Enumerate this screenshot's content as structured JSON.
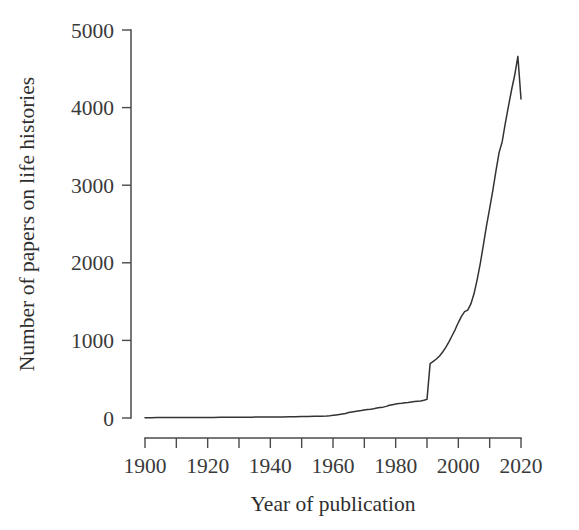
{
  "chart_data": {
    "type": "line",
    "title": "",
    "xlabel": "Year of publication",
    "ylabel": "Number of papers on life histories",
    "xlim": [
      1900,
      2020
    ],
    "ylim": [
      0,
      5000
    ],
    "grid": false,
    "legend": "none",
    "xticks": [
      1900,
      1910,
      1920,
      1930,
      1940,
      1950,
      1960,
      1970,
      1980,
      1990,
      2000,
      2010,
      2020
    ],
    "xtick_labels": [
      "1900",
      "",
      "1920",
      "",
      "1940",
      "",
      "1960",
      "",
      "1980",
      "",
      "2000",
      "",
      "2020"
    ],
    "xtick_labels_shown": [
      "1900",
      "1920",
      "1940",
      "1960",
      "1980",
      "2000",
      "2020"
    ],
    "yticks": [
      0,
      1000,
      2000,
      3000,
      4000,
      5000
    ],
    "ytick_labels": [
      "0",
      "1000",
      "2000",
      "3000",
      "4000",
      "5000"
    ],
    "series_name": "Papers on life histories",
    "line_color": "#333333",
    "x": [
      1900,
      1902,
      1904,
      1906,
      1908,
      1910,
      1912,
      1914,
      1916,
      1918,
      1920,
      1922,
      1924,
      1926,
      1928,
      1930,
      1932,
      1934,
      1936,
      1938,
      1940,
      1942,
      1944,
      1946,
      1948,
      1950,
      1952,
      1954,
      1956,
      1958,
      1959,
      1960,
      1961,
      1962,
      1963,
      1964,
      1965,
      1966,
      1967,
      1968,
      1969,
      1970,
      1971,
      1972,
      1973,
      1974,
      1975,
      1976,
      1977,
      1978,
      1979,
      1980,
      1981,
      1982,
      1983,
      1984,
      1985,
      1986,
      1987,
      1988,
      1989,
      1990,
      1991,
      1992,
      1993,
      1994,
      1995,
      1996,
      1997,
      1998,
      1999,
      2000,
      2001,
      2002,
      2003,
      2004,
      2005,
      2006,
      2007,
      2008,
      2009,
      2010,
      2011,
      2012,
      2013,
      2014,
      2015,
      2016,
      2017,
      2018,
      2019,
      2020
    ],
    "values": [
      4,
      4,
      5,
      5,
      5,
      6,
      6,
      6,
      7,
      7,
      8,
      8,
      9,
      9,
      10,
      10,
      11,
      11,
      12,
      12,
      13,
      13,
      14,
      15,
      16,
      18,
      20,
      22,
      24,
      27,
      30,
      34,
      40,
      46,
      52,
      58,
      70,
      78,
      84,
      90,
      96,
      104,
      108,
      112,
      118,
      128,
      134,
      140,
      150,
      164,
      172,
      180,
      186,
      190,
      196,
      200,
      206,
      212,
      216,
      220,
      228,
      240,
      700,
      730,
      760,
      800,
      850,
      910,
      980,
      1060,
      1140,
      1230,
      1310,
      1370,
      1390,
      1470,
      1600,
      1780,
      1990,
      2230,
      2480,
      2700,
      2930,
      3180,
      3420,
      3560,
      3800,
      4020,
      4230,
      4420,
      4660,
      4110
    ],
    "annotations": [
      {
        "text": "sharp step increase at 1991",
        "x": 1991,
        "y": 700
      },
      {
        "text": "peak",
        "x": 2019,
        "y": 4660
      },
      {
        "text": "final drop",
        "x": 2020,
        "y": 4110
      }
    ]
  },
  "figure": {
    "background_color": "#ffffff",
    "axis_color": "#4a4a4a"
  }
}
